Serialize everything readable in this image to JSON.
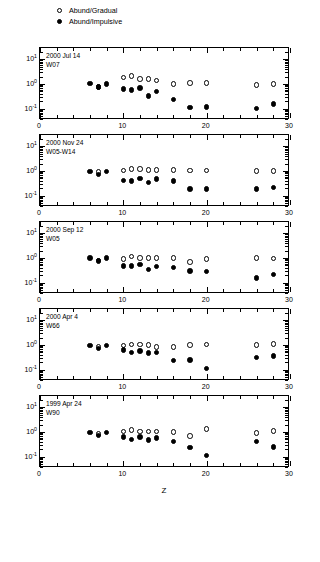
{
  "figure": {
    "xlabel": "Z",
    "ylabel": "",
    "caption": ""
  },
  "legend": {
    "position": "top-left",
    "entries": [
      {
        "label": "Abund/Gradual",
        "marker": "open-circle",
        "name": "legend-gradual"
      },
      {
        "label": "Abund/Impulsive",
        "marker": "filled-circle",
        "name": "legend-impulsive"
      }
    ]
  },
  "axes": {
    "x": {
      "min": 0,
      "max": 30,
      "ticks": [
        0,
        10,
        20,
        30
      ],
      "tick_labels": [
        "0",
        "10",
        "20",
        "30"
      ],
      "minor_step": 2
    },
    "y": {
      "type": "log",
      "min": -1.45,
      "max": 1.45,
      "ticks": [
        1,
        0,
        -1
      ],
      "tick_labels": [
        "10 1",
        "10 0",
        "10 -1"
      ],
      "exponents": [
        "1",
        "0",
        "-1"
      ],
      "mantissa": "10"
    }
  },
  "chart_data": [
    {
      "type": "scatter",
      "title": "2000 Jul 14",
      "subtitle": "W07",
      "xlabel": "Z",
      "ylabel": "",
      "xlim": [
        0,
        30
      ],
      "ylim": [
        -1.45,
        1.45
      ],
      "yscale": "log",
      "grid": false,
      "series": [
        {
          "name": "Abund/Gradual",
          "marker": "open-circle",
          "points": [
            [
              7,
              -0.11
            ],
            [
              10,
              0.26
            ],
            [
              11,
              0.33
            ],
            [
              12,
              0.2
            ],
            [
              13,
              0.2
            ],
            [
              14,
              0.14
            ],
            [
              16,
              0.0
            ],
            [
              18,
              0.03
            ],
            [
              20,
              0.03
            ],
            [
              26,
              -0.05
            ],
            [
              28,
              0.0
            ]
          ]
        },
        {
          "name": "Abund/Impulsive",
          "marker": "filled-circle",
          "points": [
            [
              6,
              0.02
            ],
            [
              7,
              -0.12
            ],
            [
              8,
              0.0
            ],
            [
              10,
              -0.2
            ],
            [
              11,
              -0.23
            ],
            [
              12,
              -0.16
            ],
            [
              13,
              -0.48
            ],
            [
              14,
              -0.31
            ],
            [
              16,
              -0.62
            ],
            [
              18,
              -0.95
            ],
            [
              20,
              -0.92
            ],
            [
              26,
              -0.98
            ],
            [
              28,
              -0.81
            ]
          ]
        }
      ]
    },
    {
      "type": "scatter",
      "title": "2000 Nov 24",
      "subtitle": "W05-W14",
      "xlabel": "Z",
      "ylabel": "",
      "xlim": [
        0,
        30
      ],
      "ylim": [
        -1.45,
        1.45
      ],
      "yscale": "log",
      "grid": false,
      "series": [
        {
          "name": "Abund/Gradual",
          "marker": "open-circle",
          "points": [
            [
              7,
              -0.05
            ],
            [
              10,
              0.02
            ],
            [
              11,
              0.07
            ],
            [
              12,
              0.07
            ],
            [
              13,
              0.05
            ],
            [
              14,
              0.05
            ],
            [
              16,
              0.03
            ],
            [
              18,
              0.02
            ],
            [
              20,
              0.02
            ],
            [
              26,
              0.0
            ],
            [
              28,
              0.0
            ]
          ]
        },
        {
          "name": "Abund/Impulsive",
          "marker": "filled-circle",
          "points": [
            [
              6,
              -0.02
            ],
            [
              7,
              -0.14
            ],
            [
              8,
              -0.02
            ],
            [
              10,
              -0.38
            ],
            [
              11,
              -0.4
            ],
            [
              12,
              -0.3
            ],
            [
              13,
              -0.47
            ],
            [
              14,
              -0.33
            ],
            [
              16,
              -0.4
            ],
            [
              18,
              -0.72
            ],
            [
              20,
              -0.72
            ],
            [
              26,
              -0.72
            ],
            [
              28,
              -0.66
            ]
          ]
        }
      ]
    },
    {
      "type": "scatter",
      "title": "2000 Sep 12",
      "subtitle": "W05",
      "xlabel": "Z",
      "ylabel": "",
      "xlim": [
        0,
        30
      ],
      "ylim": [
        -1.45,
        1.45
      ],
      "yscale": "log",
      "grid": false,
      "series": [
        {
          "name": "Abund/Gradual",
          "marker": "open-circle",
          "points": [
            [
              7,
              -0.1
            ],
            [
              10,
              -0.05
            ],
            [
              11,
              0.06
            ],
            [
              12,
              0.0
            ],
            [
              13,
              0.0
            ],
            [
              14,
              0.0
            ],
            [
              16,
              0.0
            ],
            [
              18,
              -0.16
            ],
            [
              20,
              -0.05
            ],
            [
              26,
              0.0
            ],
            [
              28,
              -0.02
            ]
          ]
        },
        {
          "name": "Abund/Impulsive",
          "marker": "filled-circle",
          "points": [
            [
              6,
              0.0
            ],
            [
              7,
              -0.12
            ],
            [
              8,
              0.0
            ],
            [
              10,
              -0.33
            ],
            [
              11,
              -0.33
            ],
            [
              12,
              -0.26
            ],
            [
              13,
              -0.47
            ],
            [
              14,
              -0.35
            ],
            [
              16,
              -0.38
            ],
            [
              18,
              -0.53
            ],
            [
              20,
              -0.55
            ],
            [
              26,
              -0.8
            ],
            [
              28,
              -0.66
            ]
          ]
        }
      ]
    },
    {
      "type": "scatter",
      "title": "2000 Apr 4",
      "subtitle": "W66",
      "xlabel": "Z",
      "ylabel": "",
      "xlim": [
        0,
        30
      ],
      "ylim": [
        -1.45,
        1.45
      ],
      "yscale": "log",
      "grid": false,
      "series": [
        {
          "name": "Abund/Gradual",
          "marker": "open-circle",
          "points": [
            [
              7,
              -0.06
            ],
            [
              10,
              -0.02
            ],
            [
              11,
              0.02
            ],
            [
              12,
              0.02
            ],
            [
              13,
              0.0
            ],
            [
              14,
              -0.09
            ],
            [
              16,
              -0.07
            ],
            [
              18,
              0.0
            ],
            [
              20,
              0.02
            ],
            [
              26,
              0.0
            ],
            [
              28,
              0.05
            ]
          ]
        },
        {
          "name": "Abund/Impulsive",
          "marker": "filled-circle",
          "points": [
            [
              6,
              -0.02
            ],
            [
              7,
              -0.14
            ],
            [
              8,
              -0.02
            ],
            [
              10,
              -0.2
            ],
            [
              11,
              -0.31
            ],
            [
              12,
              -0.23
            ],
            [
              13,
              -0.33
            ],
            [
              14,
              -0.31
            ],
            [
              16,
              -0.62
            ],
            [
              18,
              -0.6
            ],
            [
              20,
              -0.95
            ],
            [
              26,
              -0.5
            ],
            [
              28,
              -0.45
            ]
          ]
        }
      ]
    },
    {
      "type": "scatter",
      "title": "1999 Apr 24",
      "subtitle": "W90",
      "xlabel": "Z",
      "ylabel": "",
      "xlim": [
        0,
        30
      ],
      "ylim": [
        -1.45,
        1.45
      ],
      "yscale": "log",
      "grid": false,
      "series": [
        {
          "name": "Abund/Gradual",
          "marker": "open-circle",
          "points": [
            [
              7,
              -0.08
            ],
            [
              10,
              0.02
            ],
            [
              11,
              0.08
            ],
            [
              12,
              0.02
            ],
            [
              13,
              0.02
            ],
            [
              14,
              0.02
            ],
            [
              16,
              0.0
            ],
            [
              18,
              -0.16
            ],
            [
              20,
              0.12
            ],
            [
              26,
              -0.05
            ],
            [
              28,
              0.05
            ]
          ]
        },
        {
          "name": "Abund/Impulsive",
          "marker": "filled-circle",
          "points": [
            [
              6,
              -0.02
            ],
            [
              7,
              -0.14
            ],
            [
              8,
              -0.02
            ],
            [
              10,
              -0.2
            ],
            [
              11,
              -0.31
            ],
            [
              12,
              -0.2
            ],
            [
              13,
              -0.33
            ],
            [
              14,
              -0.23
            ],
            [
              16,
              -0.38
            ],
            [
              18,
              -0.62
            ],
            [
              20,
              -0.95
            ],
            [
              26,
              -0.38
            ],
            [
              28,
              -0.6
            ]
          ]
        }
      ]
    }
  ]
}
